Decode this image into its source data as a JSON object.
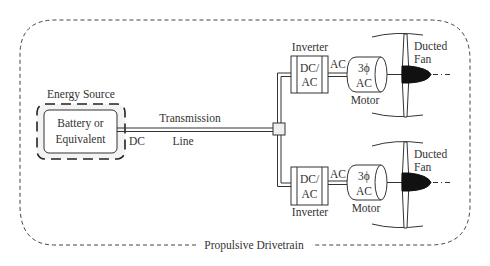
{
  "diagram": {
    "outer_label": "Propulsive Drivetrain",
    "energy_source": {
      "title": "Energy Source",
      "inner_line1": "Battery or",
      "inner_line2": "Equivalent",
      "output_label": "DC"
    },
    "transmission": {
      "line1": "Transmission",
      "line2": "Line"
    },
    "branches": [
      {
        "position": "top",
        "inverter_label": "Inverter",
        "inverter_line1": "DC/",
        "inverter_line2": "AC",
        "link_label": "AC",
        "motor_line1": "3ϕ",
        "motor_line2": "AC",
        "motor_label": "Motor",
        "fan_line1": "Ducted",
        "fan_line2": "Fan"
      },
      {
        "position": "bottom",
        "inverter_label": "Inverter",
        "inverter_line1": "DC/",
        "inverter_line2": "AC",
        "link_label": "AC",
        "motor_line1": "3ϕ",
        "motor_line2": "AC",
        "motor_label": "Motor",
        "fan_line1": "Ducted",
        "fan_line2": "Fan"
      }
    ],
    "colors": {
      "stroke": "#333333",
      "shading": "#f0f0f0",
      "hub": "#111111"
    }
  }
}
